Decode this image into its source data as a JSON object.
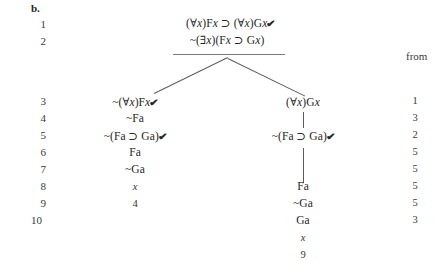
{
  "exercise": {
    "label": "b."
  },
  "columns": {
    "from_header": "from"
  },
  "line_numbers": [
    "1",
    "2",
    "3",
    "4",
    "5",
    "6",
    "7",
    "8",
    "9",
    "10"
  ],
  "premises": [
    {
      "number": "1",
      "formula": "(∀x)Fx ⊃ (∀x)Gx",
      "checked": true,
      "check_mark": "✔"
    },
    {
      "number": "2",
      "formula": "~(∃x)(Fx ⊃ Gx)",
      "checked": false,
      "check_mark": ""
    }
  ],
  "left_branch": [
    {
      "number": "3",
      "formula": "~(∀x)Fx",
      "checked": true,
      "check_mark": "✔",
      "from": "1"
    },
    {
      "number": "4",
      "formula": "~Fa",
      "checked": false,
      "check_mark": "",
      "from": "3"
    },
    {
      "number": "5",
      "formula": "~(Fa ⊃ Ga)",
      "checked": true,
      "check_mark": "✔",
      "from": "2"
    },
    {
      "number": "6",
      "formula": "Fa",
      "checked": false,
      "check_mark": "",
      "from": "5"
    },
    {
      "number": "7",
      "formula": "~Ga",
      "checked": false,
      "check_mark": "",
      "from": "5"
    }
  ],
  "left_closure": {
    "mark": "x",
    "reference": "4"
  },
  "right_branch": [
    {
      "number": "3",
      "formula": "(∀x)Gx",
      "checked": false,
      "check_mark": "",
      "from": "1"
    },
    {
      "number": "5",
      "formula": "~(Fa ⊃ Ga)",
      "checked": true,
      "check_mark": "✔",
      "from": "2"
    },
    {
      "number": "8",
      "formula": "Fa",
      "checked": false,
      "check_mark": "",
      "from": "5"
    },
    {
      "number": "9",
      "formula": "~Ga",
      "checked": false,
      "check_mark": "",
      "from": "5"
    },
    {
      "number": "10",
      "formula": "Ga",
      "checked": false,
      "check_mark": "",
      "from": "3"
    }
  ],
  "right_closure": {
    "mark": "x",
    "reference": "9"
  },
  "from_values": [
    "1",
    "3",
    "2",
    "5",
    "5",
    "5",
    "5",
    "3"
  ],
  "colors": {
    "text": "#262626",
    "rule": "#7a7a7a",
    "connector": "#5d5d5d",
    "background": "#ffffff"
  }
}
